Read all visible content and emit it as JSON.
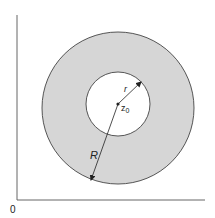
{
  "diagram": {
    "colors": {
      "background": "#ffffff",
      "annulus_fill": "#d6d6d6",
      "stroke": "#333333",
      "axis": "#555555",
      "inner_fill": "#ffffff"
    },
    "axes": {
      "origin_label": "0"
    },
    "annulus": {
      "outer_radius_label": "R",
      "inner_radius_label": "r",
      "center_label": "z",
      "center_label_subscript": "0"
    }
  }
}
